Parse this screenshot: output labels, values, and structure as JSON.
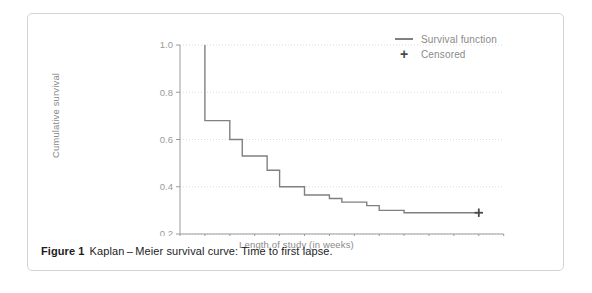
{
  "figure": {
    "caption_label": "Figure 1",
    "caption_text": "Kaplan – Meier survival curve: Time to first lapse."
  },
  "legend": {
    "position": "top-right",
    "items": [
      {
        "label": "Survival function",
        "marker": "line",
        "color": "#808080"
      },
      {
        "label": "Censored",
        "marker": "plus",
        "color": "#4a4a4a"
      }
    ]
  },
  "colors": {
    "curve": "#808080",
    "axis": "#9a9a9a",
    "grid": "#dcdcdc",
    "tick_label": "#9a9a9a",
    "axis_title": "#8a8a8a",
    "panel_border": "#d3d3d3",
    "caption": "#1d1d1d",
    "censored_marker": "#4a4a4a"
  },
  "chart_data": {
    "type": "line",
    "title": "",
    "xlabel": "Length of study (in weeks)",
    "ylabel": "Cumulative survival",
    "xlim": [
      0,
      13
    ],
    "ylim": [
      0.2,
      1.0
    ],
    "xticks": [
      0,
      1,
      2,
      3,
      4,
      5,
      6,
      7,
      8,
      9,
      10,
      11,
      12,
      13
    ],
    "xtick_labels": [
      "0",
      "1",
      "2",
      "3",
      "4",
      "5",
      "6",
      "7",
      "8",
      "9",
      "10",
      "11",
      "12",
      "13"
    ],
    "yticks": [
      0.2,
      0.4,
      0.6,
      0.8,
      1.0
    ],
    "ytick_labels": [
      "0.2",
      "0.4",
      "0.6",
      "0.8",
      "1.0"
    ],
    "grid": "horizontal-dotted",
    "step_style": "post",
    "series": [
      {
        "name": "Survival function",
        "type": "step",
        "x": [
          1.0,
          1.0,
          2.0,
          2.0,
          2.5,
          2.5,
          3.5,
          3.5,
          4.0,
          4.0,
          5.0,
          5.0,
          6.0,
          6.0,
          6.5,
          6.5,
          7.5,
          7.5,
          8.0,
          8.0,
          9.0,
          9.0,
          12.0
        ],
        "y": [
          1.0,
          0.68,
          0.68,
          0.6,
          0.6,
          0.53,
          0.53,
          0.47,
          0.47,
          0.4,
          0.4,
          0.365,
          0.365,
          0.35,
          0.35,
          0.335,
          0.335,
          0.32,
          0.32,
          0.3,
          0.3,
          0.29,
          0.29
        ],
        "steps": [
          {
            "week": 1.0,
            "survival_before": 1.0,
            "survival_after": 0.68
          },
          {
            "week": 2.0,
            "survival_before": 0.68,
            "survival_after": 0.6
          },
          {
            "week": 2.5,
            "survival_before": 0.6,
            "survival_after": 0.53
          },
          {
            "week": 3.5,
            "survival_before": 0.53,
            "survival_after": 0.47
          },
          {
            "week": 4.0,
            "survival_before": 0.47,
            "survival_after": 0.4
          },
          {
            "week": 5.0,
            "survival_before": 0.4,
            "survival_after": 0.365
          },
          {
            "week": 6.0,
            "survival_before": 0.365,
            "survival_after": 0.35
          },
          {
            "week": 6.5,
            "survival_before": 0.35,
            "survival_after": 0.335
          },
          {
            "week": 7.5,
            "survival_before": 0.335,
            "survival_after": 0.32
          },
          {
            "week": 8.0,
            "survival_before": 0.32,
            "survival_after": 0.3
          },
          {
            "week": 9.0,
            "survival_before": 0.3,
            "survival_after": 0.29
          }
        ]
      },
      {
        "name": "Censored",
        "type": "scatter",
        "marker": "plus",
        "x": [
          12.0
        ],
        "y": [
          0.29
        ]
      }
    ]
  }
}
